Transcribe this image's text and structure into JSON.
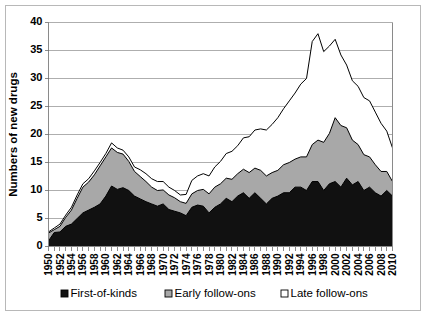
{
  "figure": {
    "y_axis_title": "Numbers of new drugs",
    "background_color": "#ffffff",
    "border_color": "#b8b8b8"
  },
  "legend": {
    "position": "bottom",
    "items": [
      {
        "label": "First-of-kinds",
        "color": "#111111",
        "marker": "filled-square"
      },
      {
        "label": "Early follow-ons",
        "color": "#a8a8a8",
        "marker": "gray-square"
      },
      {
        "label": "Late follow-ons",
        "color": "#ffffff",
        "marker": "empty-square"
      }
    ]
  },
  "axes": {
    "y_ticks": [
      "0",
      "5",
      "10",
      "15",
      "20",
      "25",
      "30",
      "35",
      "40"
    ],
    "x_ticks": [
      "1950",
      "1952",
      "1954",
      "1956",
      "1958",
      "1960",
      "1962",
      "1964",
      "1966",
      "1968",
      "1970",
      "1972",
      "1974",
      "1976",
      "1978",
      "1980",
      "1982",
      "1984",
      "1986",
      "1988",
      "1990",
      "1992",
      "1994",
      "1996",
      "1998",
      "2000",
      "2002",
      "2004",
      "2006",
      "2008",
      "2010"
    ]
  },
  "chart_data": {
    "type": "area",
    "stacked": true,
    "title": "",
    "subtitle": "",
    "xlabel": "",
    "ylabel": "Numbers of new drugs",
    "ylim": [
      0,
      40
    ],
    "xlim": [
      1950,
      2010
    ],
    "grid": true,
    "legend_position": "bottom",
    "x": [
      1950,
      1951,
      1952,
      1953,
      1954,
      1955,
      1956,
      1957,
      1958,
      1959,
      1960,
      1961,
      1962,
      1963,
      1964,
      1965,
      1966,
      1967,
      1968,
      1969,
      1970,
      1971,
      1972,
      1973,
      1974,
      1975,
      1976,
      1977,
      1978,
      1979,
      1980,
      1981,
      1982,
      1983,
      1984,
      1985,
      1986,
      1987,
      1988,
      1989,
      1990,
      1991,
      1992,
      1993,
      1994,
      1995,
      1996,
      1997,
      1998,
      1999,
      2000,
      2001,
      2002,
      2003,
      2004,
      2005,
      2006,
      2007,
      2008,
      2009,
      2010
    ],
    "categories": [
      "1950",
      "1951",
      "1952",
      "1953",
      "1954",
      "1955",
      "1956",
      "1957",
      "1958",
      "1959",
      "1960",
      "1961",
      "1962",
      "1963",
      "1964",
      "1965",
      "1966",
      "1967",
      "1968",
      "1969",
      "1970",
      "1971",
      "1972",
      "1973",
      "1974",
      "1975",
      "1976",
      "1977",
      "1978",
      "1979",
      "1980",
      "1981",
      "1982",
      "1983",
      "1984",
      "1985",
      "1986",
      "1987",
      "1988",
      "1989",
      "1990",
      "1991",
      "1992",
      "1993",
      "1994",
      "1995",
      "1996",
      "1997",
      "1998",
      "1999",
      "2000",
      "2001",
      "2002",
      "2003",
      "2004",
      "2005",
      "2006",
      "2007",
      "2008",
      "2009",
      "2010"
    ],
    "series": [
      {
        "name": "First-of-kinds",
        "color": "#111111",
        "values": [
          1.0,
          2.5,
          2.6,
          3.6,
          4.0,
          5.0,
          6.0,
          6.5,
          7.0,
          7.6,
          9.0,
          10.8,
          10.2,
          10.5,
          10.0,
          9.0,
          8.5,
          8.0,
          7.6,
          7.2,
          7.6,
          6.6,
          6.3,
          6.0,
          5.5,
          7.0,
          7.4,
          7.2,
          6.0,
          7.0,
          7.6,
          8.6,
          8.0,
          9.0,
          9.6,
          8.6,
          9.6,
          8.6,
          7.6,
          8.6,
          9.0,
          9.6,
          9.6,
          10.6,
          10.6,
          10.0,
          11.6,
          11.6,
          10.0,
          11.2,
          11.6,
          10.6,
          12.2,
          11.0,
          11.6,
          10.0,
          10.6,
          9.6,
          9.0,
          10.0,
          9.0
        ]
      },
      {
        "name": "Early follow-ons",
        "color": "#a8a8a8",
        "values": [
          1.4,
          0.5,
          1.0,
          1.6,
          2.5,
          3.6,
          4.6,
          5.0,
          5.8,
          6.8,
          7.0,
          6.8,
          6.6,
          6.0,
          5.2,
          4.4,
          4.0,
          3.6,
          3.0,
          2.8,
          2.5,
          2.6,
          2.4,
          2.0,
          2.2,
          2.4,
          2.6,
          3.0,
          3.4,
          3.6,
          3.6,
          3.6,
          4.0,
          4.0,
          4.2,
          4.6,
          4.4,
          5.0,
          5.0,
          4.6,
          4.6,
          5.0,
          5.4,
          5.0,
          5.4,
          6.0,
          6.6,
          7.4,
          8.6,
          9.0,
          11.4,
          11.0,
          9.0,
          8.0,
          6.6,
          6.4,
          5.4,
          5.0,
          4.4,
          3.4,
          2.6
        ]
      },
      {
        "name": "Late follow-ons",
        "color": "#ffffff",
        "values": [
          0.2,
          0.3,
          0.4,
          0.4,
          0.5,
          0.6,
          0.6,
          0.6,
          0.7,
          0.6,
          0.6,
          0.9,
          0.8,
          0.7,
          0.8,
          0.8,
          1.2,
          1.4,
          1.5,
          1.6,
          1.5,
          1.4,
          1.3,
          1.2,
          1.6,
          2.4,
          2.6,
          2.8,
          3.2,
          3.6,
          4.0,
          4.4,
          5.0,
          5.0,
          5.6,
          6.4,
          6.8,
          7.4,
          8.2,
          8.6,
          9.4,
          10.0,
          11.0,
          11.8,
          13.0,
          14.0,
          18.4,
          19.0,
          16.2,
          15.6,
          14.0,
          12.6,
          11.2,
          10.6,
          10.4,
          10.2,
          10.0,
          9.4,
          8.6,
          7.2,
          6.0
        ]
      }
    ],
    "totals": [
      2.6,
      3.3,
      4.0,
      5.6,
      7.0,
      9.2,
      11.2,
      12.1,
      13.5,
      15.0,
      16.6,
      18.5,
      17.6,
      17.2,
      16.0,
      14.2,
      13.7,
      13.0,
      12.1,
      11.6,
      11.6,
      10.6,
      10.0,
      9.2,
      9.3,
      11.8,
      12.6,
      13.0,
      12.6,
      14.2,
      15.2,
      16.6,
      17.0,
      18.0,
      19.4,
      19.6,
      20.8,
      21.0,
      20.8,
      21.8,
      23.0,
      24.6,
      26.0,
      27.4,
      29.0,
      30.0,
      36.6,
      38.0,
      34.8,
      35.8,
      37.0,
      34.2,
      32.4,
      29.6,
      28.6,
      26.6,
      26.0,
      24.0,
      22.0,
      20.6,
      17.6
    ]
  }
}
